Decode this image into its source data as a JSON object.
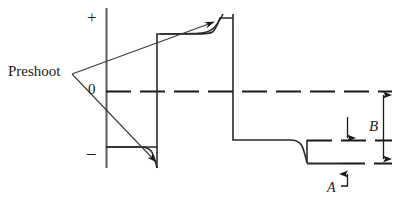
{
  "figure": {
    "type": "waveform-diagram",
    "title": "",
    "background_color": "#ffffff",
    "stroke_color": "#1a1a1a",
    "labels": {
      "preshoot": "Preshoot",
      "plus": "+",
      "zero": "0",
      "minus": "–",
      "b": "B",
      "a": "A"
    },
    "axis": {
      "vertical_axis_x": 106,
      "vertical_axis_top_y": 8,
      "vertical_axis_bottom_y": 168,
      "zero_line_y": 91,
      "zero_line_x_start": 106,
      "zero_line_x_end": 392,
      "zero_line_style": "dashed"
    },
    "waveform": {
      "description": "Square wave showing preshoot, overshoot and undershoot with settling curves",
      "low_level_y": 147,
      "high_level_y": 34,
      "settled_low_y": 140,
      "undershoot_y": 163,
      "edges_x": [
        157,
        233,
        307
      ],
      "segments": [
        {
          "name": "initial-low",
          "x_start": 106,
          "x_end": 157,
          "y": 147
        },
        {
          "name": "rising-edge",
          "x": 157,
          "y_from": 147,
          "y_to": 34
        },
        {
          "name": "high-plateau",
          "x_start": 157,
          "x_end": 233,
          "y": 34
        },
        {
          "name": "falling-edge",
          "x": 233,
          "y_from": 34,
          "y_to": 140
        },
        {
          "name": "low-plateau",
          "x_start": 233,
          "x_end": 307,
          "y": 140
        },
        {
          "name": "undershoot-tail",
          "x_start": 307,
          "x_end": 360,
          "y": 163
        }
      ]
    },
    "annotations": {
      "preshoot_leader_upper": {
        "from_x": 72,
        "from_y": 74,
        "to_x": 213,
        "to_y": 23,
        "arrow": true
      },
      "preshoot_leader_lower": {
        "from_x": 72,
        "from_y": 74,
        "to_x": 158,
        "to_y": 163,
        "arrow": true
      },
      "b_dimension": {
        "x": 383,
        "y_top": 91,
        "y_bottom": 163,
        "double_headed": true,
        "label": "B"
      },
      "a_dimension": {
        "label": "A",
        "arrow_x": 347,
        "arrow_to_y": 166,
        "leader_from_x": 340,
        "leader_y": 186
      },
      "inner_arrow": {
        "x": 347,
        "y_from": 118,
        "y_to": 140,
        "direction": "down"
      },
      "dashed_marker_lines": [
        {
          "name": "settled-low-dash",
          "y": 140,
          "x_start": 307,
          "x_end": 392
        },
        {
          "name": "undershoot-dash",
          "y": 163,
          "x_start": 307,
          "x_end": 392
        }
      ]
    }
  }
}
